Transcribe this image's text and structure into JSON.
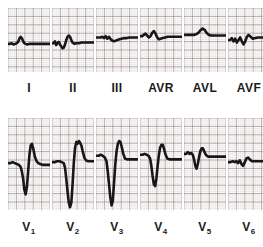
{
  "figure": {
    "kind": "12-lead-electrocardiogram",
    "background_color": "#ffffff",
    "grid_minor_color": "#d9cfcf",
    "grid_major_color": "#9a9090",
    "trace_color": "#171717"
  },
  "rows": [
    {
      "name": "limb-leads",
      "panel_width": 42,
      "panel_height": 64,
      "panel_gap": 2,
      "left_offset": 8,
      "baseline_fraction": 0.56,
      "leads": [
        {
          "label": "I",
          "sub": "",
          "name": "lead-I",
          "description": "low amplitude, flat baseline with small R and slight ST",
          "points": "0,56 5,56 9,55 13,57 17,56 21,55 24,53 27,48 30,45 33,47 36,52 39,55 42,56 46,57 50,56 55,56 60,56 66,56 72,56 78,56 84,56 90,56 96,56 100,56"
        },
        {
          "label": "II",
          "sub": "",
          "name": "lead-II",
          "description": "small complexes, ST coving and T wave",
          "points": "0,55 4,55 7,52 10,58 13,55 16,53 19,57 22,60 25,63 28,62 31,57 34,50 37,45 40,43 43,45 46,50 49,54 53,56 58,55 64,55 70,54 76,54 82,54 88,54 94,54 100,54"
        },
        {
          "label": "III",
          "sub": "",
          "name": "lead-III",
          "description": "flat low voltage with minor undulation",
          "points": "0,46 6,46 11,46 15,45 19,47 23,44 27,48 31,45 35,49 39,51 43,52 47,51 51,50 56,49 61,48 67,47 73,47 79,46 85,46 91,46 96,46 100,46"
        },
        {
          "label": "AVR",
          "sub": "",
          "name": "lead-AVR",
          "description": "small upright deflections with notching",
          "points": "0,44 5,44 9,42 13,40 17,43 21,46 25,44 29,39 33,36 37,40 41,46 45,49 49,48 54,47 60,46 66,45 72,45 78,45 84,45 90,45 95,45 100,45"
        },
        {
          "label": "AVL",
          "sub": "",
          "name": "lead-AVL",
          "description": "flat baseline with single small rounded hump",
          "points": "0,42 8,42 16,42 23,42 29,41 34,39 39,35 44,32 49,34 54,39 59,42 65,43 71,43 78,43 85,43 92,43 100,43"
        },
        {
          "label": "AVF",
          "sub": "",
          "name": "lead-AVF",
          "description": "low voltage irregular undulating baseline",
          "points": "0,50 5,50 9,47 13,52 17,48 21,54 25,50 29,46 33,52 37,57 41,52 45,45 49,42 54,45 59,48 65,47 71,46 78,46 85,46 92,46 100,46"
        }
      ]
    },
    {
      "name": "chest-leads",
      "panel_width": 42,
      "panel_height": 92,
      "panel_gap": 2,
      "left_offset": 8,
      "baseline_fraction": 0.5,
      "leads": [
        {
          "label": "V",
          "sub": "1",
          "name": "lead-V1",
          "description": "small r, deep S wave, tall sharp R with elevated ST segment",
          "points": "0,49 6,49 11,48 16,49 21,50 26,51 30,53 33,58 36,66 39,78 42,83 45,75 48,58 51,40 54,30 57,28 60,33 64,42 68,47 72,49 77,50 83,51 89,51 95,51 100,51"
        },
        {
          "label": "V",
          "sub": "2",
          "name": "lead-V2",
          "description": "deep QS complex with massive convex ST elevation (anterior injury)",
          "points": "0,48 6,48 12,47 18,47 23,48 28,49 31,54 34,66 37,80 40,92 43,97 46,92 49,72 52,48 55,32 58,26 61,28 64,25 67,27 70,30 73,36 77,43 81,46 86,47 91,47 96,47 100,47"
        },
        {
          "label": "V",
          "sub": "3",
          "name": "lead-V3",
          "description": "deep QS complex with marked coved ST elevation",
          "points": "0,41 6,41 11,40 16,41 21,43 25,47 28,58 31,72 34,86 37,95 40,90 43,70 46,50 49,36 52,28 55,25 58,26 61,31 65,39 69,44 74,45 80,45 86,45 92,45 100,45"
        },
        {
          "label": "V",
          "sub": "4",
          "name": "lead-V4",
          "description": "deep Q wave with domed ST elevation and tall T wave",
          "points": "0,40 6,40 11,39 16,40 20,41 24,44 27,52 30,63 33,72 36,74 39,66 42,52 45,40 48,32 51,29 54,29 57,33 61,40 65,44 70,45 76,45 82,45 88,45 94,45 100,45"
        },
        {
          "label": "V",
          "sub": "5",
          "name": "lead-V5",
          "description": "modest R, small S and upright rounded T wave",
          "points": "0,39 5,39 9,37 13,39 17,38 21,40 24,45 27,52 30,55 33,50 36,42 39,36 42,33 45,33 48,36 52,40 57,42 63,42 69,42 75,42 82,42 90,42 100,42"
        },
        {
          "label": "V",
          "sub": "6",
          "name": "lead-V6",
          "description": "low voltage nearly flat tracing with small notches",
          "points": "0,48 6,48 11,47 16,48 20,47 24,49 28,46 32,50 36,52 40,48 44,44 48,43 52,45 57,47 63,47 69,47 76,47 83,47 90,47 100,47"
        }
      ]
    }
  ]
}
